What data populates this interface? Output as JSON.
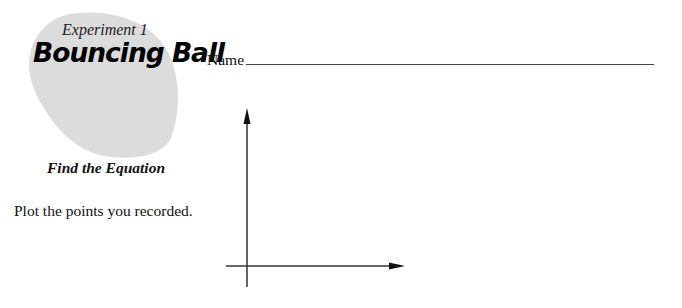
{
  "header": {
    "experiment_label": "Experiment 1",
    "title": "Bouncing Ball",
    "subtitle": "Find the Equation"
  },
  "worksheet": {
    "name_label": "Name",
    "name_value": "",
    "instructions": "Plot the points you recorded."
  },
  "graph": {
    "x_axis_label": "",
    "y_axis_label": "",
    "points": []
  },
  "colors": {
    "blob": "#dcdcdc",
    "axis": "#333333",
    "text": "#111111"
  }
}
